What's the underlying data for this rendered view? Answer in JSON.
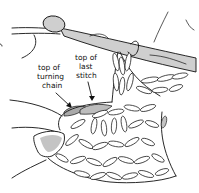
{
  "illustration": {
    "subject": "crochet hook inserted into fabric held by hand",
    "labels": {
      "turning_chain": {
        "line1": "top of",
        "line2": "turning",
        "line3": "chain"
      },
      "last_stitch": {
        "line1": "top of",
        "line2": "last",
        "line3": "stitch"
      }
    },
    "colors": {
      "ink": "#111111",
      "background": "#ffffff",
      "hook_fill": "#cfcfcf",
      "highlight_turning_chain": "#a9a9a9",
      "highlight_last_stitch": "#bdbdbd",
      "thumbnail": "#c4c4c4"
    }
  }
}
